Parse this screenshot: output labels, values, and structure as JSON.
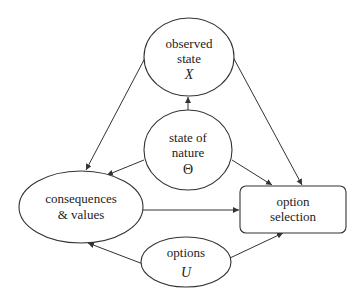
{
  "diagram": {
    "nodes": {
      "observed_state": {
        "line1": "observed",
        "line2": "state",
        "symbol": "X"
      },
      "state_of_nature": {
        "line1": "state of",
        "line2": "nature",
        "symbol": "Θ"
      },
      "consequences": {
        "line1": "consequences",
        "line2": "& values"
      },
      "option_selection": {
        "line1": "option",
        "line2": "selection"
      },
      "options": {
        "line1": "options",
        "symbol": "U"
      }
    },
    "edges": [
      {
        "from": "state_of_nature",
        "to": "observed_state"
      },
      {
        "from": "state_of_nature",
        "to": "consequences"
      },
      {
        "from": "state_of_nature",
        "to": "option_selection"
      },
      {
        "from": "observed_state",
        "to": "consequences"
      },
      {
        "from": "observed_state",
        "to": "option_selection"
      },
      {
        "from": "consequences",
        "to": "option_selection"
      },
      {
        "from": "options",
        "to": "consequences"
      },
      {
        "from": "options",
        "to": "option_selection"
      }
    ],
    "colors": {
      "stroke": "#333333",
      "text": "#222222",
      "background": "#ffffff"
    }
  }
}
